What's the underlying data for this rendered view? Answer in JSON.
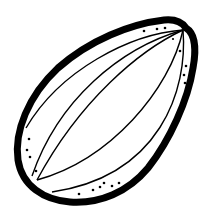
{
  "image": {
    "subject": "almond seed line drawing",
    "alt": "Black and white outline illustration of an almond with curved inner lines and speckle dots",
    "colors": {
      "stroke": "#000000",
      "background": "#ffffff"
    }
  }
}
